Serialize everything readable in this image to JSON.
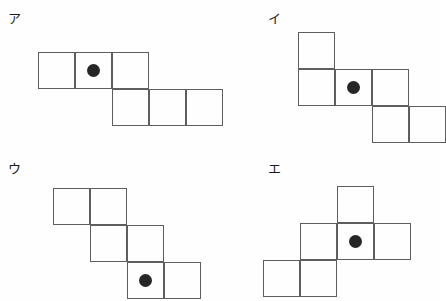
{
  "page": {
    "background_color": "#fefefe",
    "line_color": "#5e5e5e",
    "dot_color": "#262626",
    "width": 440,
    "height": 301
  },
  "figures": [
    {
      "id": "fig-a",
      "label": "ア",
      "label_pos": {
        "x": 8,
        "y": 12
      },
      "cell_size": 37,
      "origin": {
        "x": 38,
        "y": 52
      },
      "cells": [
        {
          "col": 0,
          "row": 0
        },
        {
          "col": 1,
          "row": 0
        },
        {
          "col": 2,
          "row": 0
        },
        {
          "col": 2,
          "row": 1
        },
        {
          "col": 3,
          "row": 1
        },
        {
          "col": 4,
          "row": 1
        }
      ],
      "dot": {
        "col": 1,
        "row": 0,
        "diameter": 13
      }
    },
    {
      "id": "fig-i",
      "label": "イ",
      "label_pos": {
        "x": 8,
        "y": 12
      },
      "cell_size": 37,
      "origin": {
        "x": 38,
        "y": 32
      },
      "cells": [
        {
          "col": 0,
          "row": 0
        },
        {
          "col": 0,
          "row": 1
        },
        {
          "col": 1,
          "row": 1
        },
        {
          "col": 2,
          "row": 1
        },
        {
          "col": 2,
          "row": 2
        },
        {
          "col": 3,
          "row": 2
        }
      ],
      "dot": {
        "col": 1,
        "row": 1,
        "diameter": 13
      }
    },
    {
      "id": "fig-u",
      "label": "ウ",
      "label_pos": {
        "x": 8,
        "y": 12
      },
      "cell_size": 37,
      "origin": {
        "x": 53,
        "y": 38
      },
      "cells": [
        {
          "col": 0,
          "row": 0
        },
        {
          "col": 1,
          "row": 0
        },
        {
          "col": 1,
          "row": 1
        },
        {
          "col": 2,
          "row": 1
        },
        {
          "col": 2,
          "row": 2
        },
        {
          "col": 3,
          "row": 2
        }
      ],
      "dot": {
        "col": 2,
        "row": 2,
        "diameter": 13
      }
    },
    {
      "id": "fig-e",
      "label": "エ",
      "label_pos": {
        "x": 8,
        "y": 12
      },
      "cell_size": 37,
      "origin": {
        "x": 3,
        "y": 36
      },
      "cells": [
        {
          "col": 2,
          "row": 0
        },
        {
          "col": 1,
          "row": 1
        },
        {
          "col": 2,
          "row": 1
        },
        {
          "col": 3,
          "row": 1
        },
        {
          "col": 0,
          "row": 2
        },
        {
          "col": 1,
          "row": 2
        }
      ],
      "dot": {
        "col": 2,
        "row": 1,
        "diameter": 13
      }
    }
  ]
}
